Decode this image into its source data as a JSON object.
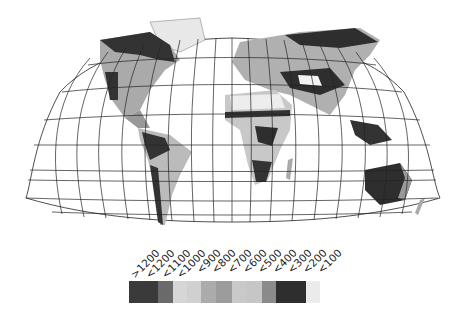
{
  "map": {
    "projection": "Robinson-like world projection with graticule",
    "graticule_color": "#222222",
    "land_base_color": "#d0d0d0"
  },
  "legend": {
    "classes": [
      {
        "label": ">1200",
        "color": "#3a3a3a"
      },
      {
        "label": "<1200",
        "color": "#6a6a6a"
      },
      {
        "label": "<1100",
        "color": "#d6d6d6"
      },
      {
        "label": "<1000",
        "color": "#d0d0d0"
      },
      {
        "label": "<900",
        "color": "#ababab"
      },
      {
        "label": "<800",
        "color": "#9c9c9c"
      },
      {
        "label": "<700",
        "color": "#c9c9c9"
      },
      {
        "label": "<600",
        "color": "#c6c6c6"
      },
      {
        "label": "<500",
        "color": "#8a8a8a"
      },
      {
        "label": "<400",
        "color": "#2e2e2e"
      },
      {
        "label": "<300",
        "color": "#2e2e2e"
      },
      {
        "label": "<200",
        "color": "#ebebeb"
      },
      {
        "label": "<100",
        "color": "#ffffff"
      }
    ]
  }
}
